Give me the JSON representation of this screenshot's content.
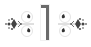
{
  "badge": {
    "numeral": "1",
    "colors": {
      "numeral": "#6b6b6b",
      "ornament_dark": "#3a3a3a",
      "ornament_light": "#d6d6d6",
      "background": "#ffffff"
    },
    "ornaments": [
      {
        "side": "left",
        "icon": "flourish-icon"
      },
      {
        "side": "right",
        "icon": "flourish-icon"
      }
    ]
  }
}
